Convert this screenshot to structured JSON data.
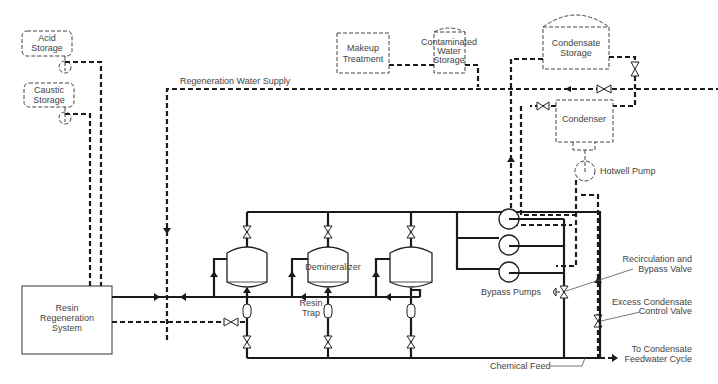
{
  "diagram": {
    "components": {
      "acid_storage": {
        "line1": "Acid",
        "line2": "Storage"
      },
      "caustic_storage": {
        "line1": "Caustic",
        "line2": "Storage"
      },
      "makeup_treatment": {
        "line1": "Makeup",
        "line2": "Treatment"
      },
      "contaminated_water_storage": {
        "line1": "Contaminated",
        "line2": "Water",
        "line3": "Storage"
      },
      "condensate_storage": {
        "line1": "Condensate",
        "line2": "Storage"
      },
      "condenser": {
        "label": "Condenser"
      },
      "hotwell_pump": {
        "label": "Hotwell Pump"
      },
      "resin_regeneration": {
        "line1": "Resin",
        "line2": "Regeneration",
        "line3": "System"
      },
      "demineralizer": {
        "label": "Demineralizer"
      },
      "resin_trap": {
        "line1": "Resin",
        "line2": "Trap"
      },
      "bypass_pumps": {
        "label": "Bypass Pumps"
      }
    },
    "lines": {
      "regeneration_water_supply": "Regeneration  Water Supply",
      "chemical_feed": "Chemical Feed"
    },
    "callouts": {
      "recirc_valve": {
        "line1": "Recirculation and",
        "line2": "Bypass Valve"
      },
      "excess_valve": {
        "line1": "Excess Condensate",
        "line2": "Control Valve"
      },
      "to_feedwater": {
        "line1": "To Condensate",
        "line2": "Feedwater Cycle"
      }
    },
    "legend": {
      "solid_line": "process piping",
      "dashed_line": "auxiliary / regeneration piping",
      "line_color": "#1a1a1a"
    }
  }
}
